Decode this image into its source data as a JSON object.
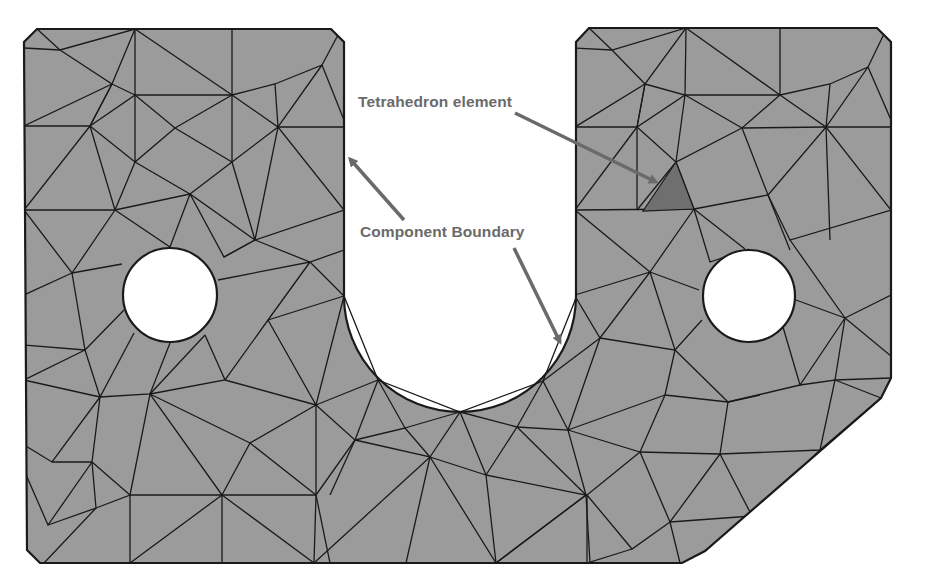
{
  "figure": {
    "colors": {
      "background": "#ffffff",
      "mesh_fill": "#9b9b9b",
      "mesh_edge": "#1a1a1a",
      "highlight_element": "#6f6f6f",
      "annotation": "#6a6a6a"
    }
  },
  "annotations": {
    "tetrahedron": {
      "label": "Tetrahedron element"
    },
    "boundary": {
      "label": "Component Boundary"
    }
  }
}
